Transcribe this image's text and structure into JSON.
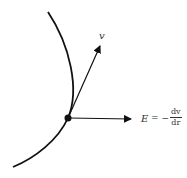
{
  "diagram": {
    "curve": {
      "stroke": "#111111"
    },
    "point": {
      "color": "#111111"
    },
    "vector_v": {
      "label": "v"
    },
    "vector_E": {
      "lhs": "E",
      "equals": "= −",
      "numerator": "dv",
      "denominator": "dr"
    }
  }
}
